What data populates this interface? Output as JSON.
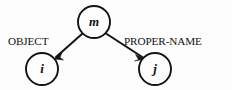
{
  "diagram": {
    "type": "directed-graph",
    "background_color": "#fdfdfd",
    "ink_color": "#131313",
    "nodes": [
      {
        "id": "m",
        "label": "m",
        "role": "root",
        "cx": 94,
        "cy": 22,
        "r": 16
      },
      {
        "id": "i",
        "label": "i",
        "role": "leaf",
        "cx": 42,
        "cy": 69,
        "r": 16
      },
      {
        "id": "j",
        "label": "j",
        "role": "leaf",
        "cx": 155,
        "cy": 69,
        "r": 16
      }
    ],
    "edges": [
      {
        "id": "edge-object",
        "label": "OBJECT",
        "from": "m",
        "to": "i",
        "direction": "down-left",
        "label_x": 8,
        "label_y": 45
      },
      {
        "id": "edge-proper-name",
        "label": "PROPER-NAME",
        "from": "m",
        "to": "j",
        "direction": "down-right",
        "label_x": 124,
        "label_y": 45
      }
    ]
  }
}
